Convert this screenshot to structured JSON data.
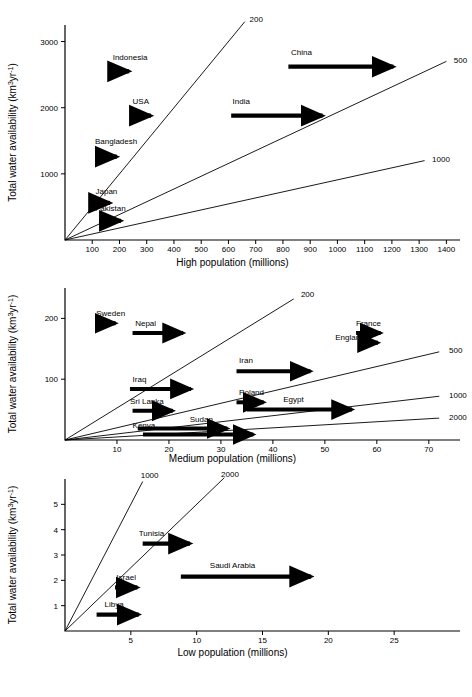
{
  "figure": {
    "title": "",
    "y_axis_label": "Total water availability (km³yr⁻¹)"
  },
  "chart_data": [
    {
      "id": "high",
      "type": "scatter",
      "title": "",
      "xlabel": "High population (millions)",
      "ylabel": "Total water availability (km³yr⁻¹)",
      "xlim": [
        0,
        1450
      ],
      "ylim": [
        0,
        3250
      ],
      "grid": false,
      "legend": "none",
      "xticks": [
        100,
        200,
        300,
        400,
        500,
        600,
        700,
        800,
        900,
        1000,
        1100,
        1200,
        1300,
        1400
      ],
      "xticklabels": [
        "100",
        "200",
        "300",
        "400",
        "500",
        "600",
        "700",
        "800",
        "900",
        "1000",
        "1100",
        "1200",
        "1300",
        "1400"
      ],
      "yticks": [
        1000,
        2000,
        3000
      ],
      "yticklabels": [
        "1000",
        "2000",
        "3000"
      ],
      "iso_lines": [
        {
          "label": "200",
          "per_capita_m3": 200,
          "x_end": 660,
          "y_end": 3300,
          "label_x": 670,
          "label_y": 3340
        },
        {
          "label": "500",
          "per_capita_m3": 500,
          "x_end": 1400,
          "y_end": 2700,
          "label_x": 1420,
          "label_y": 2720
        },
        {
          "label": "1000",
          "per_capita_m3": 1000,
          "x_end": 1320,
          "y_end": 1200,
          "label_x": 1340,
          "label_y": 1220
        }
      ],
      "arrows": [
        {
          "name": "Indonesia",
          "x_start": 180,
          "x_end": 250,
          "y": 2550,
          "label_x": 175,
          "label_y": 2720
        },
        {
          "name": "USA",
          "x_start": 250,
          "x_end": 330,
          "y": 1880,
          "label_x": 248,
          "label_y": 2060
        },
        {
          "name": "Bangladesh",
          "x_start": 120,
          "x_end": 205,
          "y": 1260,
          "label_x": 110,
          "label_y": 1450
        },
        {
          "name": "Japan",
          "x_start": 120,
          "x_end": 180,
          "y": 560,
          "label_x": 112,
          "label_y": 700
        },
        {
          "name": "Pakistan",
          "x_start": 125,
          "x_end": 220,
          "y": 290,
          "label_x": 110,
          "label_y": 440
        },
        {
          "name": "India",
          "x_start": 610,
          "x_end": 960,
          "y": 1880,
          "label_x": 615,
          "label_y": 2060
        },
        {
          "name": "China",
          "x_start": 820,
          "x_end": 1220,
          "y": 2620,
          "label_x": 830,
          "label_y": 2800
        }
      ]
    },
    {
      "id": "medium",
      "type": "scatter",
      "title": "",
      "xlabel": "Medium population (millions)",
      "ylabel": "Total water availability (km³yr⁻¹)",
      "xlim": [
        0,
        76
      ],
      "ylim": [
        0,
        250
      ],
      "grid": false,
      "legend": "none",
      "xticks": [
        10,
        20,
        30,
        40,
        50,
        60,
        70
      ],
      "xticklabels": [
        "10",
        "20",
        "30",
        "40",
        "50",
        "60",
        "70"
      ],
      "yticks": [
        100,
        200
      ],
      "yticklabels": [
        "100",
        "200"
      ],
      "iso_lines": [
        {
          "label": "200",
          "per_capita_m3": 200,
          "x_end": 44,
          "y_end": 232,
          "label_x": 45,
          "label_y": 240
        },
        {
          "label": "500",
          "per_capita_m3": 500,
          "x_end": 72,
          "y_end": 145,
          "label_x": 73.5,
          "label_y": 148
        },
        {
          "label": "1000",
          "per_capita_m3": 1000,
          "x_end": 72,
          "y_end": 72,
          "label_x": 73.5,
          "label_y": 74
        },
        {
          "label": "2000",
          "per_capita_m3": 2000,
          "x_end": 72,
          "y_end": 36,
          "label_x": 73.5,
          "label_y": 38
        }
      ],
      "arrows": [
        {
          "name": "Sweden",
          "x_start": 6.5,
          "x_end": 10.5,
          "y": 192,
          "label_x": 6.0,
          "label_y": 204
        },
        {
          "name": "Nepal",
          "x_start": 13.0,
          "x_end": 23.5,
          "y": 176,
          "label_x": 13.5,
          "label_y": 188
        },
        {
          "name": "France",
          "x_start": 56.0,
          "x_end": 61.5,
          "y": 176,
          "label_x": 56.0,
          "label_y": 188
        },
        {
          "name": "England",
          "x_start": 59.0,
          "x_end": 61.0,
          "y": 160,
          "label_x": 52.0,
          "label_y": 164
        },
        {
          "name": "Iran",
          "x_start": 33.0,
          "x_end": 48.0,
          "y": 113,
          "label_x": 33.5,
          "label_y": 126
        },
        {
          "name": "Iraq",
          "x_start": 12.5,
          "x_end": 25.0,
          "y": 84,
          "label_x": 13.0,
          "label_y": 96
        },
        {
          "name": "Poland",
          "x_start": 33.0,
          "x_end": 39.0,
          "y": 62,
          "label_x": 33.5,
          "label_y": 74
        },
        {
          "name": "Sri Lanka",
          "x_start": 13.0,
          "x_end": 21.5,
          "y": 48,
          "label_x": 12.5,
          "label_y": 60
        },
        {
          "name": "Egypt",
          "x_start": 35.0,
          "x_end": 56.0,
          "y": 50,
          "label_x": 42.0,
          "label_y": 63
        },
        {
          "name": "Sudan",
          "x_start": 14.0,
          "x_end": 32.0,
          "y": 19,
          "label_x": 24.0,
          "label_y": 30
        },
        {
          "name": "Kenya",
          "x_start": 15.0,
          "x_end": 37.0,
          "y": 9,
          "label_x": 13.0,
          "label_y": 19
        }
      ],
      "extra_arrow_notes": "Iran arrow continues to ~65; Egypt arrow continues to ~65; Iraq arrow head at ~25"
    },
    {
      "id": "low",
      "type": "scatter",
      "title": "",
      "xlabel": "Low population (millions)",
      "ylabel": "Total water availability (km³yr⁻¹)",
      "xlim": [
        0,
        30
      ],
      "ylim": [
        0,
        6
      ],
      "grid": false,
      "legend": "none",
      "xticks": [
        5,
        10,
        15,
        20,
        25
      ],
      "xticklabels": [
        "5",
        "10",
        "15",
        "20",
        "25"
      ],
      "yticks": [
        1,
        2,
        3,
        4,
        5
      ],
      "yticklabels": [
        "1",
        "2",
        "3",
        "4",
        "5"
      ],
      "iso_lines": [
        {
          "label": "1000",
          "per_capita_m3": 1000,
          "x_end": 5.9,
          "y_end": 5.9,
          "label_x": 5.6,
          "label_y": 6.15
        },
        {
          "label": "2000",
          "per_capita_m3": 2000,
          "x_end": 12.1,
          "y_end": 6.05,
          "label_x": 11.7,
          "label_y": 6.2
        }
      ],
      "arrows": [
        {
          "name": "Tunisia",
          "x_start": 5.9,
          "x_end": 9.8,
          "y": 3.45,
          "label_x": 5.6,
          "label_y": 3.75
        },
        {
          "name": "Saudi Arabia",
          "x_start": 8.8,
          "x_end": 19.0,
          "y": 2.15,
          "label_x": 11.0,
          "label_y": 2.48
        },
        {
          "name": "Israel",
          "x_start": 3.8,
          "x_end": 5.8,
          "y": 1.72,
          "label_x": 3.9,
          "label_y": 2.02
        },
        {
          "name": "Libya",
          "x_start": 2.4,
          "x_end": 5.9,
          "y": 0.65,
          "label_x": 3.0,
          "label_y": 0.95
        }
      ]
    }
  ]
}
